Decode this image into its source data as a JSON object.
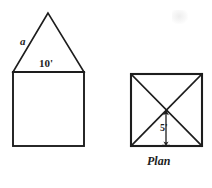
{
  "figure": {
    "title_label": "Plan",
    "background_color": "#ffffff",
    "stroke_color": "#1d1d1d",
    "elevation": {
      "name": "house-elevation",
      "roof_side_label": "a",
      "base_width_label": "10'",
      "triangle_apex": {
        "x": 48,
        "y": 13
      },
      "triangle_left": {
        "x": 13,
        "y": 72
      },
      "triangle_right": {
        "x": 84,
        "y": 72
      },
      "square_top": 72,
      "square_bottom": 146,
      "square_left": 13,
      "square_right": 84
    },
    "plan": {
      "name": "plan-square",
      "caption": "Plan",
      "half_width_label": "5'",
      "left": 131,
      "top": 74,
      "right": 202,
      "bottom": 146,
      "center": {
        "x": 166,
        "y": 110
      },
      "diagonals": 2,
      "dimension_arrow": {
        "orientation": "vertical",
        "from_y": 110,
        "to_y": 145,
        "x": 166,
        "label": "5'"
      }
    },
    "artifact": {
      "name": "scan-smudge",
      "description": "faint grey scanning smudge"
    }
  }
}
